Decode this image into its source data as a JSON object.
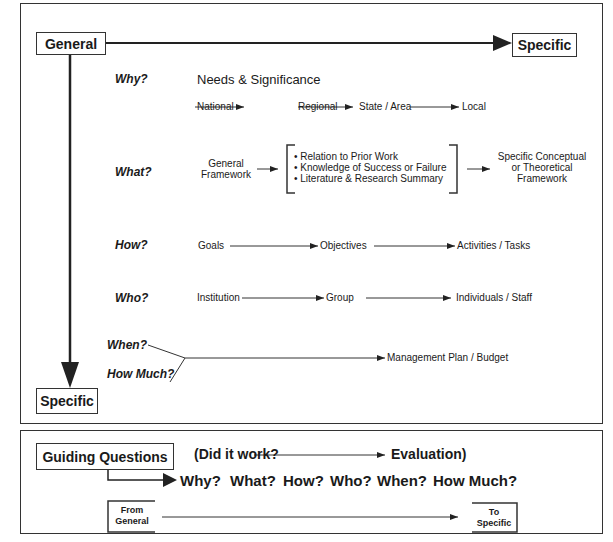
{
  "diagram": {
    "top_panel": {
      "general_label": "General",
      "specific_right_label": "Specific",
      "specific_bottom_label": "Specific",
      "rows": [
        {
          "question": "Why?",
          "heading": "Needs & Significance",
          "flow": [
            "National",
            "Regional",
            "State / Area",
            "Local"
          ]
        },
        {
          "question": "What?",
          "source": [
            "General",
            "Framework"
          ],
          "bracket_items": [
            "• Relation to Prior Work",
            "• Knowledge of Success or Failure",
            "• Literature &  Research Summary"
          ],
          "target": [
            "Specific Conceptual",
            "or Theoretical",
            "Framework"
          ]
        },
        {
          "question": "How?",
          "flow": [
            "Goals",
            "Objectives",
            "Activities / Tasks"
          ]
        },
        {
          "question": "Who?",
          "flow": [
            "Institution",
            "Group",
            "Individuals / Staff"
          ]
        },
        {
          "questions": [
            "When?",
            "How Much?"
          ],
          "target": "Management Plan / Budget"
        }
      ]
    },
    "bottom_panel": {
      "guiding_label": "Guiding Questions",
      "did_it_work": "(Did it work?",
      "evaluation": "Evaluation)",
      "questions": [
        "Why?",
        "What?",
        "How?",
        "Who?",
        "When?",
        "How Much?"
      ],
      "from": [
        "From",
        "General"
      ],
      "to": [
        "To",
        "Specific"
      ]
    }
  }
}
